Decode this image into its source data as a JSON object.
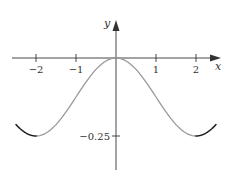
{
  "chart_data": {
    "type": "line",
    "title": "",
    "xlabel": "x",
    "ylabel": "y",
    "xlim": [
      -2.7,
      2.7
    ],
    "ylim": [
      -0.36,
      0.11
    ],
    "grid": false,
    "legend": null,
    "x_ticks": [
      -2,
      -1,
      1,
      2
    ],
    "x_tick_labels": [
      "−2",
      "−1",
      "1",
      "2"
    ],
    "y_ticks": [
      -0.25
    ],
    "y_tick_labels": [
      "−0.25"
    ],
    "series": [
      {
        "name": "curve",
        "color": "#999999",
        "end_color": "#222222",
        "x": [
          -2.5,
          -2.25,
          -2.0,
          -1.75,
          -1.5,
          -1.25,
          -1.0,
          -0.75,
          -0.5,
          -0.25,
          0.0,
          0.25,
          0.5,
          0.75,
          1.0,
          1.25,
          1.5,
          1.75,
          2.0,
          2.25,
          2.5
        ],
        "y": [
          -0.213,
          -0.244,
          -0.25,
          -0.244,
          -0.213,
          -0.173,
          -0.125,
          -0.077,
          -0.037,
          -0.01,
          0.0,
          -0.01,
          -0.037,
          -0.077,
          -0.125,
          -0.173,
          -0.213,
          -0.244,
          -0.25,
          -0.244,
          -0.213
        ]
      }
    ],
    "annotations": []
  },
  "colors": {
    "axis": "#333333",
    "curve": "#999999",
    "curve_ends": "#222222"
  }
}
